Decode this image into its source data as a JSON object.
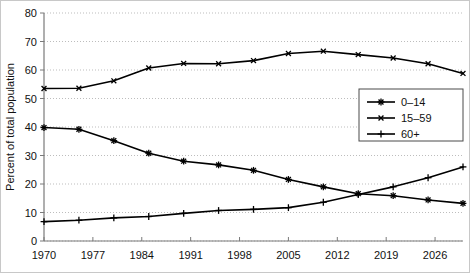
{
  "chart_data": {
    "type": "line",
    "title": "",
    "subtitle": "",
    "xlabel": "",
    "ylabel": "Percent of total population",
    "xlim": [
      1970,
      2030
    ],
    "ylim": [
      0,
      80
    ],
    "grid": "horizontal-dotted",
    "legend_position": "inside-lower-right",
    "x_tick_labels": [
      "1970",
      "1977",
      "1984",
      "1991",
      "1998",
      "2005",
      "2012",
      "2019",
      "2026"
    ],
    "x_ticks": [
      1970,
      1977,
      1984,
      1991,
      1998,
      2005,
      2012,
      2019,
      2026
    ],
    "y_tick_labels": [
      "0",
      "10",
      "20",
      "30",
      "40",
      "50",
      "60",
      "70",
      "80"
    ],
    "y_ticks": [
      0,
      10,
      20,
      30,
      40,
      50,
      60,
      70,
      80
    ],
    "x": [
      1970,
      1975,
      1980,
      1985,
      1990,
      1995,
      2000,
      2005,
      2010,
      2015,
      2020,
      2025,
      2030
    ],
    "series": [
      {
        "name": "0–14",
        "marker": "asterisk",
        "values": [
          39.8,
          39.2,
          35.2,
          30.8,
          28.0,
          26.7,
          24.8,
          21.6,
          19.0,
          16.6,
          15.9,
          14.4,
          13.2
        ]
      },
      {
        "name": "15–59",
        "marker": "x",
        "values": [
          53.5,
          53.6,
          56.2,
          60.7,
          62.3,
          62.2,
          63.3,
          65.8,
          66.6,
          65.4,
          64.2,
          62.2,
          58.8
        ]
      },
      {
        "name": "60+",
        "marker": "plus",
        "values": [
          6.8,
          7.3,
          8.1,
          8.6,
          9.7,
          10.7,
          11.1,
          11.7,
          13.6,
          16.3,
          19.0,
          22.2,
          26.0
        ]
      }
    ]
  },
  "legend": {
    "items": [
      {
        "label": "0–14",
        "marker": "asterisk"
      },
      {
        "label": "15–59",
        "marker": "x"
      },
      {
        "label": "60+",
        "marker": "plus"
      }
    ]
  },
  "colors": {
    "series": "#000000",
    "gridline": "#bdbdbd",
    "axis": "#7a7a7a",
    "text": "#111111",
    "background": "#ffffff",
    "frame": "#c8c8c8"
  }
}
